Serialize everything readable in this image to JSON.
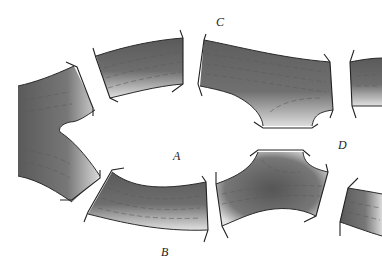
{
  "diagram": {
    "type": "road network / bridges diagram",
    "regions": [
      {
        "id": "A",
        "label": "A"
      },
      {
        "id": "B",
        "label": "B"
      },
      {
        "id": "C",
        "label": "C"
      },
      {
        "id": "D",
        "label": "D"
      }
    ],
    "colors": {
      "road_dark": "#4a4a4a",
      "road_light": "#d8d8d8",
      "outline": "#2a2a2a",
      "background": "#ffffff"
    },
    "segments": [
      "left-junction",
      "top-left-bridge-road",
      "top-middle-junction",
      "top-right-stub",
      "bottom-left-bridge-road",
      "bottom-middle-junction",
      "bottom-right-stub"
    ]
  }
}
